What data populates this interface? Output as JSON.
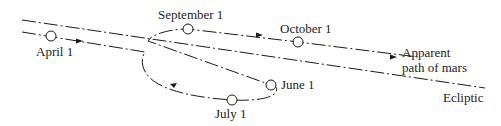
{
  "diagram": {
    "lines": {
      "ecliptic_label": "Ecliptic",
      "apparent_path_label_line1": "Apparent",
      "apparent_path_label_line2": "path of mars"
    },
    "positions": [
      {
        "date": "April 1",
        "x": 51,
        "y": 36
      },
      {
        "date": "June 1",
        "x": 271,
        "y": 85
      },
      {
        "date": "July 1",
        "x": 232,
        "y": 100
      },
      {
        "date": "September 1",
        "x": 188,
        "y": 29
      },
      {
        "date": "October 1",
        "x": 298,
        "y": 42
      }
    ],
    "colors": {
      "stroke": "#1a1a1a",
      "text": "#222222",
      "background": "#ffffff"
    }
  }
}
